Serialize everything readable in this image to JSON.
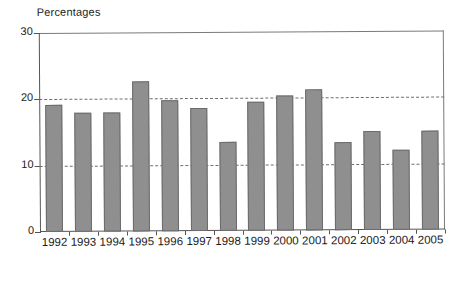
{
  "chart_data": {
    "type": "bar",
    "title": "",
    "subtitle": "",
    "ylabel": "Percentages",
    "xlabel": "",
    "categories": [
      "1992",
      "1993",
      "1994",
      "1995",
      "1996",
      "1997",
      "1998",
      "1999",
      "2000",
      "2001",
      "2002",
      "2003",
      "2004",
      "2005"
    ],
    "values": [
      19.1,
      18.0,
      17.9,
      22.6,
      19.7,
      18.5,
      13.4,
      19.5,
      20.3,
      21.2,
      13.2,
      15.0,
      12.0,
      14.9
    ],
    "ylim": [
      0,
      30
    ],
    "yticks": [
      0,
      10,
      20,
      30
    ],
    "ytick_labels": [
      "0",
      "10",
      "20",
      "30"
    ],
    "gridlines": [
      10,
      20
    ],
    "grid": "dashed-horizontal",
    "legend": "none",
    "bar_color": "#8f8f8f",
    "bar_edge_color": "#6b6b6b",
    "axis_color": "#555555"
  },
  "figure": {
    "axis_label": "Percentages",
    "caption": ""
  }
}
